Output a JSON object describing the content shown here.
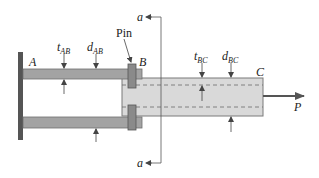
{
  "figure": {
    "colors": {
      "bar_fill": "#a3a3a3",
      "bar_stroke": "#6e6e6e",
      "tube_fill": "#d9d9d9",
      "tube_stroke": "#7a7a7a",
      "pin_fill": "#8a8a8a",
      "wall_fill": "#555555",
      "line": "#444444"
    }
  },
  "labels": {
    "point_a": "A",
    "point_b": "B",
    "point_c": "C",
    "pin": "Pin",
    "load": "P",
    "section_top": "a",
    "section_bottom": "a",
    "t_ab": {
      "main": "t",
      "sub": "AB"
    },
    "d_ab": {
      "main": "d",
      "sub": "AB"
    },
    "t_bc": {
      "main": "t",
      "sub": "BC"
    },
    "d_bc": {
      "main": "d",
      "sub": "BC"
    }
  }
}
